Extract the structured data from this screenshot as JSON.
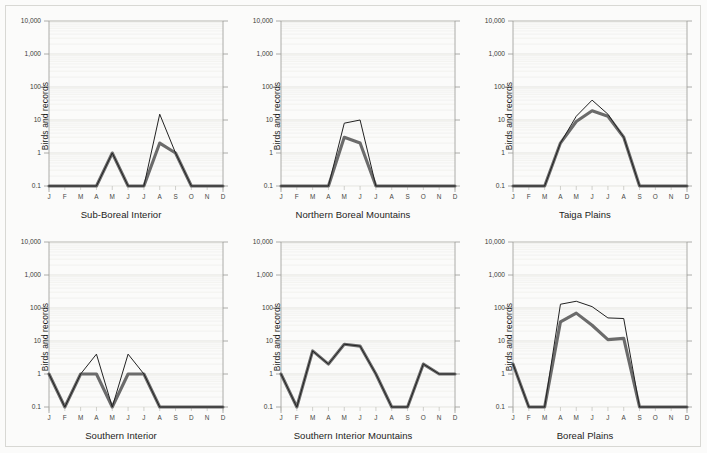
{
  "figure": {
    "background_color": "#fbfbfa",
    "page_background_color": "#f2f2ef",
    "border_color": "#d8d8d4",
    "rows": 2,
    "columns": 3
  },
  "axis": {
    "ylabel": "Birds and records",
    "ytick_labels": [
      "10,000",
      "1,000",
      "100",
      "10",
      "1",
      "0.1"
    ],
    "ytick_values": [
      10000,
      1000,
      100,
      10,
      1,
      0.1
    ],
    "ylim": [
      0.1,
      10000
    ],
    "yscale": "log",
    "grid": "faint horizontal log minor gridlines",
    "gridline_color": "#ededea",
    "axis_line_color": "#9a9a95",
    "thin_line_color": "#222222",
    "thick_line_color": "#6b6b6b"
  },
  "series_names": {
    "thin": "Records",
    "thick": "Birds"
  },
  "chart_data": [
    {
      "type": "line",
      "title": "Sub-Boreal Interior",
      "xlabel": "",
      "ylabel": "Birds and records",
      "yscale": "log",
      "ylim": [
        0.1,
        10000
      ],
      "grid": true,
      "legend": "none",
      "categories": [
        "J",
        "F",
        "M",
        "A",
        "M",
        "J",
        "J",
        "A",
        "S",
        "O",
        "N",
        "D"
      ],
      "series": [
        {
          "name": "Records",
          "style": "thin",
          "values": [
            0.1,
            0.1,
            0.1,
            0.1,
            1,
            0.1,
            0.1,
            15,
            1,
            0.1,
            0.1,
            0.1
          ]
        },
        {
          "name": "Birds",
          "style": "thick",
          "values": [
            0.1,
            0.1,
            0.1,
            0.1,
            1,
            0.1,
            0.1,
            2,
            1,
            0.1,
            0.1,
            0.1
          ]
        }
      ]
    },
    {
      "type": "line",
      "title": "Northern Boreal Mountains",
      "xlabel": "",
      "ylabel": "Birds and records",
      "yscale": "log",
      "ylim": [
        0.1,
        10000
      ],
      "grid": true,
      "legend": "none",
      "categories": [
        "J",
        "F",
        "M",
        "A",
        "M",
        "J",
        "J",
        "A",
        "S",
        "O",
        "N",
        "D"
      ],
      "series": [
        {
          "name": "Records",
          "style": "thin",
          "values": [
            0.1,
            0.1,
            0.1,
            0.1,
            8,
            10,
            0.1,
            0.1,
            0.1,
            0.1,
            0.1,
            0.1
          ]
        },
        {
          "name": "Birds",
          "style": "thick",
          "values": [
            0.1,
            0.1,
            0.1,
            0.1,
            3,
            2,
            0.1,
            0.1,
            0.1,
            0.1,
            0.1,
            0.1
          ]
        }
      ]
    },
    {
      "type": "line",
      "title": "Taiga Plains",
      "xlabel": "",
      "ylabel": "Birds and records",
      "yscale": "log",
      "ylim": [
        0.1,
        10000
      ],
      "grid": true,
      "legend": "none",
      "categories": [
        "J",
        "F",
        "M",
        "A",
        "M",
        "J",
        "J",
        "A",
        "S",
        "O",
        "N",
        "D"
      ],
      "series": [
        {
          "name": "Records",
          "style": "thin",
          "values": [
            0.1,
            0.1,
            0.1,
            2,
            13,
            40,
            15,
            3,
            0.1,
            0.1,
            0.1,
            0.1
          ]
        },
        {
          "name": "Birds",
          "style": "thick",
          "values": [
            0.1,
            0.1,
            0.1,
            2,
            9,
            19,
            13,
            3,
            0.1,
            0.1,
            0.1,
            0.1
          ]
        }
      ]
    },
    {
      "type": "line",
      "title": "Southern Interior",
      "xlabel": "",
      "ylabel": "Birds and records",
      "yscale": "log",
      "ylim": [
        0.1,
        10000
      ],
      "grid": true,
      "legend": "none",
      "categories": [
        "J",
        "F",
        "M",
        "A",
        "M",
        "J",
        "J",
        "A",
        "S",
        "D",
        "N",
        "D"
      ],
      "series": [
        {
          "name": "Records",
          "style": "thin",
          "values": [
            1,
            0.1,
            1,
            4,
            0.1,
            4,
            1,
            0.1,
            0.1,
            0.1,
            0.1,
            0.1
          ]
        },
        {
          "name": "Birds",
          "style": "thick",
          "values": [
            1,
            0.1,
            1,
            1,
            0.1,
            1,
            1,
            0.1,
            0.1,
            0.1,
            0.1,
            0.1
          ]
        }
      ]
    },
    {
      "type": "line",
      "title": "Southern Interior Mountains",
      "xlabel": "",
      "ylabel": "Birds and records",
      "yscale": "log",
      "ylim": [
        0.1,
        10000
      ],
      "grid": true,
      "legend": "none",
      "categories": [
        "J",
        "F",
        "M",
        "A",
        "M",
        "J",
        "J",
        "A",
        "S",
        "O",
        "N",
        "D"
      ],
      "series": [
        {
          "name": "Records",
          "style": "thin",
          "values": [
            1,
            0.1,
            5,
            2,
            8,
            7,
            1,
            0.1,
            0.1,
            2,
            1,
            1
          ]
        },
        {
          "name": "Birds",
          "style": "thick",
          "values": [
            1,
            0.1,
            5,
            2,
            8,
            7,
            1,
            0.1,
            0.1,
            2,
            1,
            1
          ]
        }
      ]
    },
    {
      "type": "line",
      "title": "Boreal Plains",
      "xlabel": "",
      "ylabel": "Birds and records",
      "yscale": "log",
      "ylim": [
        0.1,
        10000
      ],
      "grid": true,
      "legend": "none",
      "categories": [
        "J",
        "F",
        "M",
        "A",
        "M",
        "J",
        "J",
        "A",
        "S",
        "O",
        "N",
        "D"
      ],
      "series": [
        {
          "name": "Records",
          "style": "thin",
          "values": [
            2,
            0.1,
            0.1,
            130,
            160,
            110,
            50,
            48,
            0.1,
            0.1,
            0.1,
            0.1
          ]
        },
        {
          "name": "Birds",
          "style": "thick",
          "values": [
            2,
            0.1,
            0.1,
            38,
            70,
            30,
            11,
            12,
            0.1,
            0.1,
            0.1,
            0.1
          ]
        }
      ]
    }
  ]
}
